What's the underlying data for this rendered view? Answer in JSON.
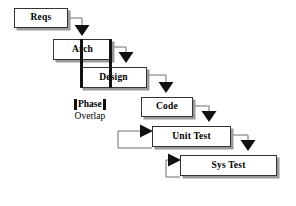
{
  "diagram": {
    "type": "waterfall-lifecycle",
    "boxes": [
      {
        "id": "reqs",
        "label": "Reqs",
        "x": 14,
        "y": 8,
        "w": 54,
        "h": 20
      },
      {
        "id": "arch",
        "label": "Arch",
        "x": 53,
        "y": 39,
        "w": 59,
        "h": 21
      },
      {
        "id": "design",
        "label": "Design",
        "x": 80,
        "y": 67,
        "w": 67,
        "h": 21
      },
      {
        "id": "code",
        "label": "Code",
        "x": 141,
        "y": 97,
        "w": 52,
        "h": 20
      },
      {
        "id": "unit-test",
        "label": "Unit Test",
        "x": 152,
        "y": 126,
        "w": 79,
        "h": 21
      },
      {
        "id": "sys-test",
        "label": "Sys Test",
        "x": 180,
        "y": 155,
        "w": 97,
        "h": 21
      }
    ],
    "overlap_bars": [
      {
        "id": "bar-arch-left",
        "x": 80,
        "y": 39,
        "h": 49
      },
      {
        "id": "bar-arch-right",
        "x": 109,
        "y": 39,
        "h": 49
      }
    ],
    "legend": {
      "line1": "Phase",
      "line2": "Overlap",
      "x": 74,
      "y": 99
    },
    "flow_arrows": [
      {
        "from": "reqs",
        "to": "arch"
      },
      {
        "from": "arch",
        "to": "design"
      },
      {
        "from": "design",
        "to": "code"
      },
      {
        "from": "code",
        "to": "unit-test"
      },
      {
        "from": "unit-test",
        "to": "sys-test"
      }
    ],
    "feedback_arrows": [
      {
        "from": "unit-test",
        "to": "unit-test",
        "note": "rework loop into Unit Test"
      },
      {
        "from": "sys-test",
        "to": "sys-test",
        "note": "rework loop into Sys Test"
      }
    ],
    "colors": {
      "box_fill": "#ffffff",
      "box_border": "#333333",
      "box_shadow": "#9a9a9a",
      "line": "#6f6f6f",
      "arrow": "#111111",
      "text": "#000000",
      "background": "#ffffff"
    }
  }
}
